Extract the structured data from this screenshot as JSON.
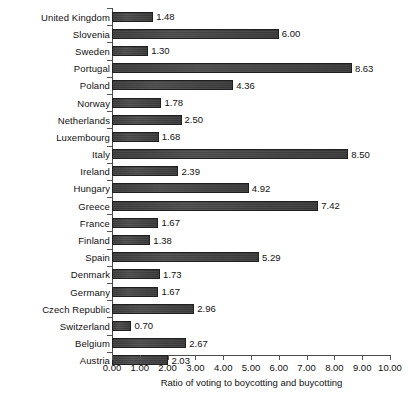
{
  "chart_data": {
    "type": "bar",
    "orientation": "horizontal",
    "title": "",
    "xlabel": "Ratio of voting to boycotting and buycotting",
    "ylabel": "",
    "xlim": [
      0,
      10
    ],
    "xticks": [
      "0.00",
      "1.00",
      "2.00",
      "3.00",
      "4.00",
      "5.00",
      "6.00",
      "7.00",
      "8.00",
      "9.00",
      "10.00"
    ],
    "grid": false,
    "legend": null,
    "categories": [
      "United Kingdom",
      "Slovenia",
      "Sweden",
      "Portugal",
      "Poland",
      "Norway",
      "Netherlands",
      "Luxembourg",
      "Italy",
      "Ireland",
      "Hungary",
      "Greece",
      "France",
      "Finland",
      "Spain",
      "Denmark",
      "Germany",
      "Czech Republic",
      "Switzerland",
      "Belgium",
      "Austria"
    ],
    "values": [
      1.48,
      6.0,
      1.3,
      8.63,
      4.36,
      1.78,
      2.5,
      1.68,
      8.5,
      2.39,
      4.92,
      7.42,
      1.67,
      1.38,
      5.29,
      1.73,
      1.67,
      2.96,
      0.7,
      2.67,
      2.03
    ],
    "value_labels": [
      "1.48",
      "6.00",
      "1.30",
      "8.63",
      "4.36",
      "1.78",
      "2.50",
      "1.68",
      "8.50",
      "2.39",
      "4.92",
      "7.42",
      "1.67",
      "1.38",
      "5.29",
      "1.73",
      "1.67",
      "2.96",
      "0.70",
      "2.67",
      "2.03"
    ],
    "bar_color": "#424242",
    "bar_edge_color": "#1f1f1f",
    "background_color": "#ffffff"
  }
}
